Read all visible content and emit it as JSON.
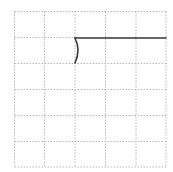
{
  "diagram": {
    "type": "grid-with-path",
    "grid": {
      "columns": 5,
      "rows": 6,
      "x_lines": [
        14.5,
        44.5,
        75,
        105.5,
        136,
        166
      ],
      "y_lines": [
        11.5,
        37.5,
        63.5,
        89.5,
        115.5,
        141.5,
        167
      ],
      "line_color": "#b8b8b8",
      "line_style": "dotted"
    },
    "path": {
      "stroke_color": "#3a3a3a",
      "stroke_width": 1.6,
      "segments": [
        {
          "kind": "line",
          "from": [
            75,
            38
          ],
          "to": [
            166,
            38
          ]
        },
        {
          "kind": "arc",
          "from": [
            75,
            38
          ],
          "control": [
            81,
            50
          ],
          "to": [
            75,
            63
          ]
        }
      ]
    }
  }
}
